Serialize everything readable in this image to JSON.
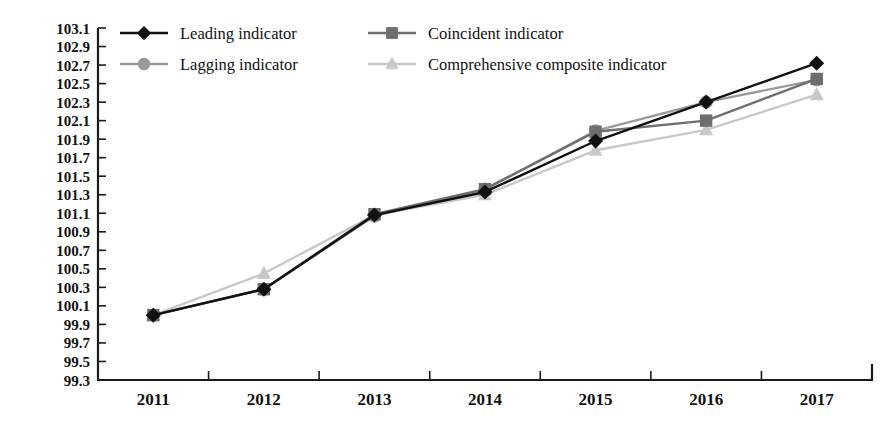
{
  "chart_data": {
    "type": "line",
    "title": "",
    "subtitle": "",
    "xlabel": "",
    "ylabel": "",
    "categories": [
      "2011",
      "2012",
      "2013",
      "2014",
      "2015",
      "2016",
      "2017"
    ],
    "ylim": [
      99.3,
      103.1
    ],
    "ytick_step": 0.2,
    "ytick_labels": [
      "103.1",
      "102.9",
      "102.7",
      "102.5",
      "102.3",
      "102.1",
      "101.9",
      "101.7",
      "101.5",
      "101.3",
      "101.1",
      "100.9",
      "100.7",
      "100.5",
      "100.3",
      "100.1",
      "99.9",
      "99.7",
      "99.5",
      "99.3"
    ],
    "grid": false,
    "legend_position": "top-left",
    "series": [
      {
        "name": "Leading indicator",
        "marker": "diamond",
        "color": "#111111",
        "values": [
          100.0,
          100.28,
          101.08,
          101.33,
          101.88,
          102.3,
          102.72
        ]
      },
      {
        "name": "Coincident indicator",
        "marker": "square",
        "color": "#6e6e6e",
        "values": [
          100.0,
          100.28,
          101.09,
          101.36,
          101.98,
          102.1,
          102.55
        ]
      },
      {
        "name": "Lagging indicator",
        "marker": "circle",
        "color": "#9a9a9a",
        "values": [
          100.0,
          100.28,
          101.07,
          101.36,
          101.99,
          102.3,
          102.54
        ]
      },
      {
        "name": "Comprehensive composite indicator",
        "marker": "triangle",
        "color": "#c8c8c8",
        "values": [
          100.0,
          100.45,
          101.08,
          101.3,
          101.78,
          102.0,
          102.38
        ]
      }
    ]
  },
  "legend": {
    "items": [
      {
        "label": "Leading indicator"
      },
      {
        "label": "Coincident indicator"
      },
      {
        "label": "Lagging indicator"
      },
      {
        "label": "Comprehensive composite indicator"
      }
    ]
  }
}
